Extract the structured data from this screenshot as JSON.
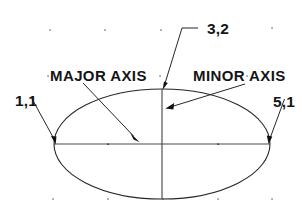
{
  "diagram": {
    "background_color": "#ffffff",
    "line_color": "#1a1a1a",
    "labels": {
      "top_point": "3,2",
      "left_point": "1,1",
      "right_point": "5,1",
      "major_axis": "MAJOR  AXIS",
      "minor_axis": "MINOR  AXIS"
    },
    "geometry": {
      "ellipse": {
        "center_x": 162,
        "center_y": 144,
        "radius_x": 108,
        "radius_y": 55
      },
      "major_axis_endpoints": [
        [
          54,
          144
        ],
        [
          270,
          144
        ]
      ],
      "minor_axis_endpoints": [
        [
          162,
          89
        ],
        [
          162,
          199
        ]
      ]
    },
    "grid_dots": [
      [
        50,
        30
      ],
      [
        105,
        30
      ],
      [
        161,
        30
      ],
      [
        272,
        28
      ],
      [
        48,
        76
      ],
      [
        160,
        76
      ],
      [
        247,
        76
      ],
      [
        108,
        144
      ],
      [
        218,
        144
      ],
      [
        53,
        199
      ],
      [
        108,
        199
      ],
      [
        163,
        199
      ],
      [
        218,
        199
      ],
      [
        272,
        199
      ]
    ],
    "leaders": [
      {
        "name": "top-point-leader",
        "label": "3,2",
        "path": "M 198 28 L 182 28 L 163 88"
      },
      {
        "name": "left-point-leader",
        "label": "1,1",
        "path": "M 31 98 L 56 143"
      },
      {
        "name": "right-point-leader",
        "label": "5,1",
        "path": "M 284 99 L 269 142"
      },
      {
        "name": "major-axis-leader",
        "label": "MAJOR  AXIS",
        "path": "M 83 83 L 139 142"
      },
      {
        "name": "minor-axis-leader",
        "label": "MINOR  AXIS",
        "path": "M 245 84 L 166 108"
      }
    ]
  }
}
